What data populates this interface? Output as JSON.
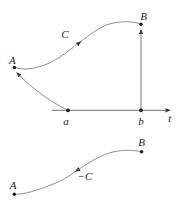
{
  "colors": {
    "background": "#ffffff",
    "line": "#8f8f8f",
    "marker": "#1d1d1d",
    "arrow": "#3f3f3f",
    "text": "#1d1d1d"
  },
  "top_diagram": {
    "point_A_label": "A",
    "point_B_label": "B",
    "curve_label": "C",
    "axis_tick_a_label": "a",
    "axis_tick_b_label": "b",
    "axis_label": "t"
  },
  "bottom_diagram": {
    "point_A_label": "A",
    "point_B_label": "B",
    "curve_label": "−C"
  }
}
